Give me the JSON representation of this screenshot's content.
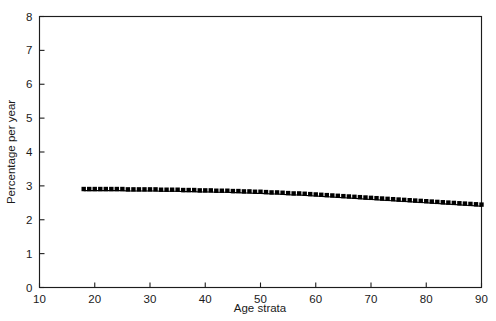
{
  "chart_data": {
    "type": "line",
    "title": "",
    "subtitle": "",
    "xlabel": "Age strata",
    "ylabel": "Percentage per year",
    "xlim": [
      10,
      90
    ],
    "ylim": [
      0,
      8
    ],
    "xticks": [
      10,
      20,
      30,
      40,
      50,
      60,
      70,
      80,
      90
    ],
    "yticks": [
      0,
      1,
      2,
      3,
      4,
      5,
      6,
      7,
      8
    ],
    "xtick_labels": [
      "10",
      "20",
      "30",
      "40",
      "50",
      "60",
      "70",
      "80",
      "90"
    ],
    "ytick_labels": [
      "0",
      "1",
      "2",
      "3",
      "4",
      "5",
      "6",
      "7",
      "8"
    ],
    "grid": false,
    "legend": null,
    "legend_position": "none",
    "marker": "square",
    "marker_color": "#000000",
    "line_color": "#000000",
    "frame_color": "#1d1d1d",
    "background_color": "#ffffff",
    "annotations": [],
    "series": [
      {
        "name": "Percentage per year",
        "x": [
          18,
          19,
          20,
          21,
          22,
          23,
          24,
          25,
          26,
          27,
          28,
          29,
          30,
          31,
          32,
          33,
          34,
          35,
          36,
          37,
          38,
          39,
          40,
          41,
          42,
          43,
          44,
          45,
          46,
          47,
          48,
          49,
          50,
          51,
          52,
          53,
          54,
          55,
          56,
          57,
          58,
          59,
          60,
          61,
          62,
          63,
          64,
          65,
          66,
          67,
          68,
          69,
          70,
          71,
          72,
          73,
          74,
          75,
          76,
          77,
          78,
          79,
          80,
          81,
          82,
          83,
          84,
          85,
          86,
          87,
          88,
          89,
          90
        ],
        "values": [
          2.86,
          2.86,
          2.86,
          2.86,
          2.86,
          2.86,
          2.86,
          2.86,
          2.85,
          2.85,
          2.85,
          2.85,
          2.85,
          2.85,
          2.84,
          2.84,
          2.84,
          2.84,
          2.83,
          2.83,
          2.83,
          2.82,
          2.82,
          2.82,
          2.81,
          2.81,
          2.81,
          2.8,
          2.8,
          2.79,
          2.79,
          2.78,
          2.78,
          2.77,
          2.76,
          2.76,
          2.75,
          2.74,
          2.73,
          2.73,
          2.72,
          2.71,
          2.7,
          2.69,
          2.68,
          2.67,
          2.66,
          2.65,
          2.64,
          2.63,
          2.62,
          2.61,
          2.6,
          2.59,
          2.58,
          2.57,
          2.56,
          2.55,
          2.54,
          2.53,
          2.52,
          2.51,
          2.5,
          2.49,
          2.48,
          2.47,
          2.46,
          2.45,
          2.44,
          2.43,
          2.42,
          2.41,
          2.4
        ]
      }
    ]
  }
}
